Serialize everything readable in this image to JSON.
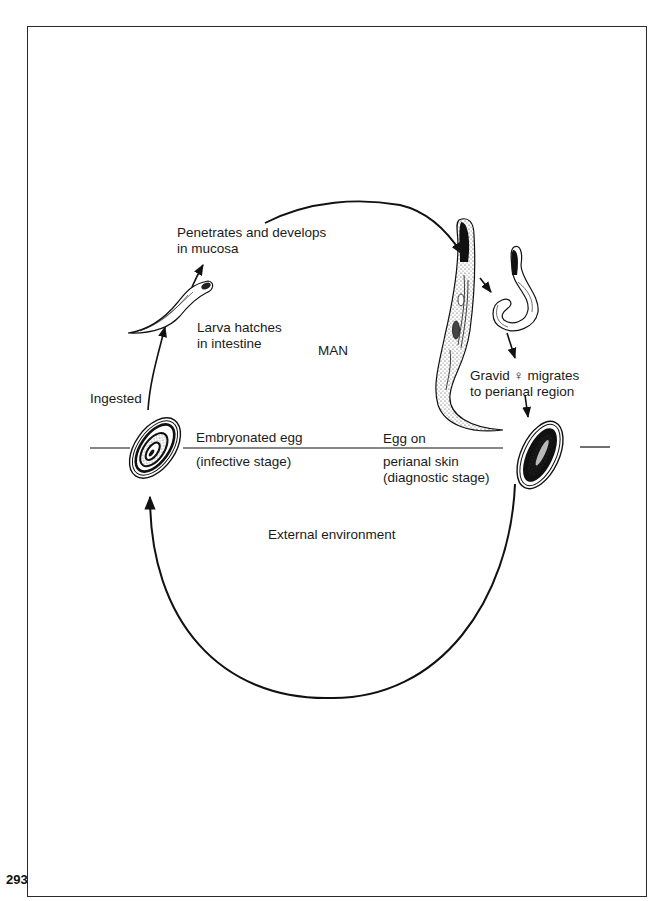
{
  "page": {
    "page_number": "293"
  },
  "diagram": {
    "type": "life-cycle",
    "zones": {
      "host": "MAN",
      "environment": "External environment"
    },
    "stages": [
      {
        "id": "larva",
        "lines": [
          "Larva hatches",
          "in intestine"
        ]
      },
      {
        "id": "mucosa",
        "lines": [
          "Penetrates and develops",
          "in mucosa"
        ]
      },
      {
        "id": "gravid-female",
        "lines": [
          "Gravid ♀ migrates",
          "to perianal region"
        ]
      },
      {
        "id": "egg-perianal",
        "above": "Egg on",
        "lines": [
          "perianal skin",
          "(diagnostic stage)"
        ]
      },
      {
        "id": "egg-embryonated",
        "above": "Embryonated egg",
        "lines": [
          "(infective stage)"
        ]
      },
      {
        "id": "ingested",
        "lines": [
          "Ingested"
        ]
      }
    ],
    "colors": {
      "ink": "#111111",
      "paper": "#ffffff",
      "frame": "#2a2a2a"
    }
  }
}
